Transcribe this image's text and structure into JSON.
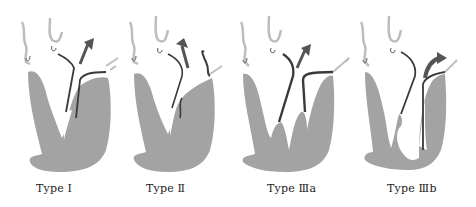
{
  "figure": {
    "colors": {
      "myocardium": "#a3a3a3",
      "vessel_outline": "#bdbdbd",
      "septum_line": "#3a3a3a",
      "arrow": "#555555",
      "background": "#ffffff"
    },
    "panels": [
      {
        "id": "type-1",
        "label": "Type Ⅰ"
      },
      {
        "id": "type-2",
        "label": "Type Ⅱ"
      },
      {
        "id": "type-3a",
        "label": "Type Ⅲa"
      },
      {
        "id": "type-3b",
        "label": "Type Ⅲb"
      }
    ]
  }
}
